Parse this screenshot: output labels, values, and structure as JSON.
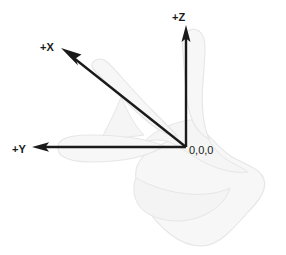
{
  "diagram": {
    "background_color": "#ffffff",
    "axis_color": "#1a1a1a",
    "hand_fill_color": "#f7f7f7",
    "hand_outline_color": "#e3e3e3",
    "origin": {
      "label": "0,0,0",
      "x": 186,
      "y": 147
    },
    "axes": [
      {
        "id": "z",
        "label": "+Z",
        "direction": "up",
        "label_x": 172,
        "label_y": 21,
        "line": {
          "x1": 186,
          "y1": 147,
          "x2": 186,
          "y2": 25
        },
        "arrow_tip_x": 186,
        "arrow_tip_y": 25
      },
      {
        "id": "x",
        "label": "+X",
        "direction": "up-left",
        "label_x": 40,
        "label_y": 51,
        "line": {
          "x1": 186,
          "y1": 147,
          "x2": 61,
          "y2": 48
        },
        "arrow_tip_x": 61,
        "arrow_tip_y": 48
      },
      {
        "id": "y",
        "label": "+Y",
        "direction": "left",
        "label_x": 12,
        "label_y": 153,
        "line": {
          "x1": 186,
          "y1": 147,
          "x2": 32,
          "y2": 147
        },
        "arrow_tip_x": 32,
        "arrow_tip_y": 147
      }
    ],
    "hand": {
      "description": "right hand silhouette with thumb up, index finger pointing upper-left, middle finger pointing left, remaining fingers curled into palm"
    }
  }
}
